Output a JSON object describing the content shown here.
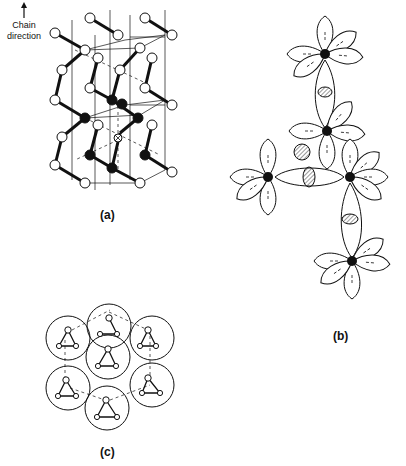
{
  "figure": {
    "panels": [
      {
        "id": "a",
        "label": "(a)",
        "description": "Helical chain crystal structure with unit cell prisms"
      },
      {
        "id": "b",
        "label": "(b)",
        "description": "Orbital lobe diagram showing bonding between atoms"
      },
      {
        "id": "c",
        "label": "(c)",
        "description": "Hexagonal packing of chains viewed along chain axis"
      }
    ],
    "annotation": {
      "arrow": "up-arrow",
      "line1": "Chain",
      "line2": "direction"
    }
  },
  "colors": {
    "ink": "#111111",
    "background": "#ffffff",
    "hatch": "#555555"
  }
}
